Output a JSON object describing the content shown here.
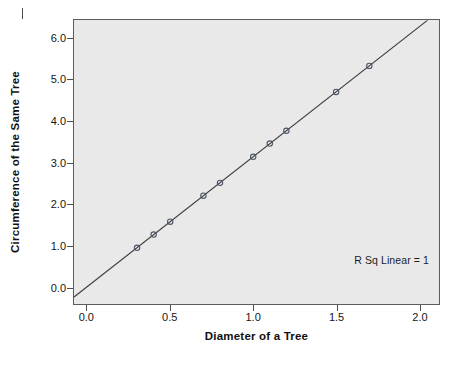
{
  "chart_data": {
    "type": "scatter",
    "title": "",
    "xlabel": "Diameter of a Tree",
    "ylabel": "Circumference of the Same Tree",
    "xlim": [
      -0.08,
      2.12
    ],
    "ylim": [
      -0.42,
      6.45
    ],
    "xticks": [
      "0.0",
      "0.5",
      "1.0",
      "1.5",
      "2.0"
    ],
    "xtick_values": [
      0.0,
      0.5,
      1.0,
      1.5,
      2.0
    ],
    "yticks": [
      "0.0",
      "1.0",
      "2.0",
      "3.0",
      "4.0",
      "5.0",
      "6.0"
    ],
    "ytick_values": [
      0.0,
      1.0,
      2.0,
      3.0,
      4.0,
      5.0,
      6.0
    ],
    "grid": false,
    "legend": "none",
    "annotation": "R Sq Linear = 1",
    "marker": "open-circle",
    "marker_color": "#4d5668",
    "plot_background": "#e9e9e9",
    "line_color": "#3c3c3c",
    "series": [
      {
        "name": "Tree measurements",
        "x": [
          0.3,
          0.4,
          0.5,
          0.7,
          0.8,
          1.0,
          1.1,
          1.2,
          1.5,
          1.7
        ],
        "y": [
          0.94,
          1.26,
          1.57,
          2.2,
          2.51,
          3.14,
          3.46,
          3.77,
          4.71,
          5.34
        ]
      }
    ],
    "fit_line": {
      "type": "linear",
      "slope": 3.1416,
      "intercept": 0.0,
      "r_squared": 1,
      "x_start": -0.08,
      "x_end": 2.05
    }
  }
}
